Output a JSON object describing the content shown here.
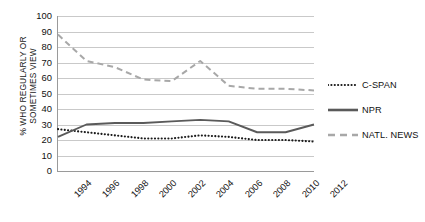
{
  "chart_data": {
    "type": "line",
    "title": "",
    "xlabel": "",
    "ylabel": "% WHO REGULARLY OR SOMETIMES VIEW",
    "ylabel_lines": [
      "% WHO REGULARLY OR",
      "SOMETIMES VIEW"
    ],
    "ylim": [
      0,
      100
    ],
    "ytick_values": [
      0,
      10,
      20,
      30,
      40,
      50,
      60,
      70,
      80,
      90,
      100
    ],
    "ytick_labels": [
      "0",
      "10",
      "20",
      "30",
      "40",
      "50",
      "60",
      "70",
      "80",
      "90",
      "100"
    ],
    "grid": true,
    "grid_axis": "y",
    "legend_position": "right",
    "categories": [
      1994,
      1996,
      1998,
      2000,
      2002,
      2004,
      2006,
      2008,
      2010,
      2012
    ],
    "xtick_labels": [
      "1994",
      "1996",
      "1998",
      "2000",
      "2002",
      "2004",
      "2006",
      "2008",
      "2010",
      "2012"
    ],
    "series": [
      {
        "name": "C-SPAN",
        "style": "dotted",
        "color": "#1a1a1a",
        "values": [
          27,
          25,
          23,
          21,
          21,
          23,
          22,
          20,
          20,
          19
        ]
      },
      {
        "name": "NPR",
        "style": "solid",
        "color": "#5a5a5a",
        "values": [
          22,
          30,
          31,
          31,
          32,
          33,
          32,
          25,
          25,
          30
        ]
      },
      {
        "name": "NATL. NEWS",
        "style": "dashed",
        "color": "#a8a8a8",
        "values": [
          88,
          71,
          67,
          59,
          58,
          71,
          55,
          53,
          53,
          52
        ]
      }
    ]
  },
  "legend": {
    "items": [
      {
        "label": "C-SPAN",
        "icon": "dotted-line-icon"
      },
      {
        "label": "NPR",
        "icon": "solid-line-icon"
      },
      {
        "label": "NATL. NEWS",
        "icon": "dashed-line-icon"
      }
    ]
  }
}
